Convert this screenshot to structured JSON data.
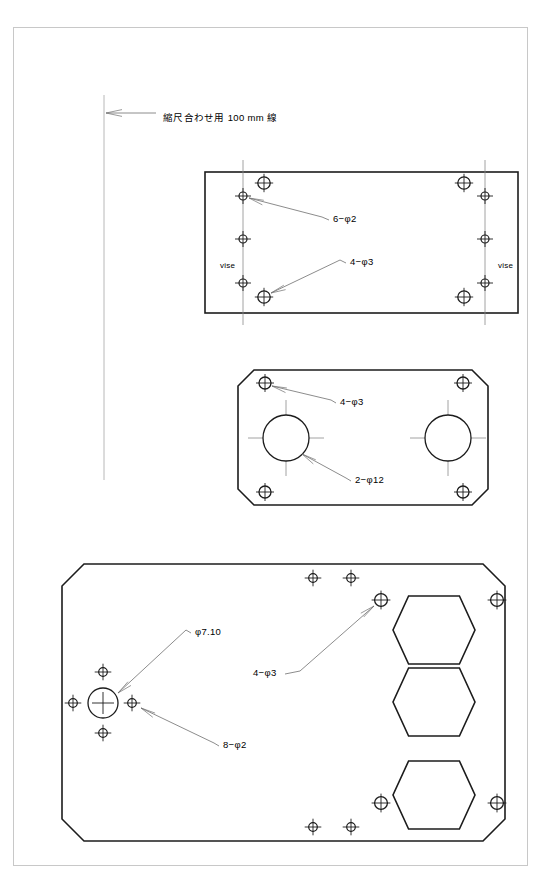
{
  "sheet": {
    "frame": {
      "x": 13,
      "y": 27,
      "width": 514,
      "height": 838
    },
    "background_color": "#ffffff",
    "frame_color": "#c8c8c8",
    "line_color": "#1c1c1c",
    "annotation_color": "#6e6e6e"
  },
  "scale_reference": {
    "label": "縮尺合わせ用 100 mm 線",
    "label_x": 163,
    "label_y": 117,
    "line_x": 104,
    "line_y_top": 95,
    "line_y_bottom": 480,
    "arrow_from_x": 156,
    "arrow_to_x": 106,
    "arrow_y": 113
  },
  "parts": [
    {
      "name": "part-rectangular-plate",
      "outline_type": "rectangle",
      "x": 205,
      "y": 172,
      "width": 313,
      "height": 141,
      "centerlines": [
        {
          "x": 243,
          "y1": 160,
          "y2": 325
        },
        {
          "x": 485,
          "y1": 160,
          "y2": 325
        }
      ],
      "holes_phi3": [
        {
          "cx": 264,
          "cy": 183,
          "r": 6.2
        },
        {
          "cx": 464,
          "cy": 183,
          "r": 6.2
        },
        {
          "cx": 264,
          "cy": 297,
          "r": 6.2
        },
        {
          "cx": 464,
          "cy": 297,
          "r": 6.2
        }
      ],
      "holes_phi2": [
        {
          "cx": 243,
          "cy": 196,
          "r": 4.0
        },
        {
          "cx": 243,
          "cy": 239,
          "r": 4.0
        },
        {
          "cx": 243,
          "cy": 283,
          "r": 4.0
        },
        {
          "cx": 485,
          "cy": 196,
          "r": 4.0
        },
        {
          "cx": 485,
          "cy": 239,
          "r": 4.0
        },
        {
          "cx": 485,
          "cy": 283,
          "r": 4.0
        }
      ],
      "labels": [
        {
          "text": "6−φ2",
          "x": 333,
          "y": 220,
          "leader_to_x": 249,
          "leader_to_y": 198,
          "leader_mid_x": 322,
          "leader_mid_y": 217
        },
        {
          "text": "4−φ3",
          "x": 350,
          "y": 263,
          "leader_to_x": 271,
          "leader_to_y": 293,
          "leader_mid_x": 340,
          "leader_mid_y": 260
        }
      ],
      "side_labels": [
        {
          "text": "vise",
          "x": 220,
          "y": 268
        },
        {
          "text": "vise",
          "x": 498,
          "y": 268
        }
      ]
    },
    {
      "name": "part-chamfered-plate-2holes",
      "outline_type": "chamfered-rectangle",
      "x": 238,
      "y": 370,
      "width": 250,
      "height": 135,
      "chamfer": 16,
      "holes_phi3": [
        {
          "cx": 265,
          "cy": 383,
          "r": 6.0
        },
        {
          "cx": 463,
          "cy": 383,
          "r": 6.0
        },
        {
          "cx": 265,
          "cy": 492,
          "r": 6.0
        },
        {
          "cx": 463,
          "cy": 492,
          "r": 6.0
        }
      ],
      "holes_phi12": [
        {
          "cx": 286,
          "cy": 438,
          "r": 23
        },
        {
          "cx": 448,
          "cy": 438,
          "r": 23
        }
      ],
      "labels": [
        {
          "text": "4−φ3",
          "x": 340,
          "y": 403,
          "leader_to_x": 272,
          "leader_to_y": 386,
          "leader_mid_x": 331,
          "leader_mid_y": 400
        },
        {
          "text": "2−φ12",
          "x": 355,
          "y": 481,
          "leader_to_x": 302,
          "leader_to_y": 454,
          "leader_mid_x": 346,
          "leader_mid_y": 478
        }
      ]
    },
    {
      "name": "part-chamfered-baseplate",
      "outline_type": "chamfered-rectangle",
      "x": 62,
      "y": 564,
      "width": 443,
      "height": 277,
      "chamfer": 22,
      "center_hole": {
        "cx": 103,
        "cy": 703,
        "r": 15,
        "label": "φ7.10"
      },
      "holes_phi2": [
        {
          "cx": 103,
          "cy": 672,
          "r": 4.3
        },
        {
          "cx": 103,
          "cy": 733,
          "r": 4.3
        },
        {
          "cx": 73,
          "cy": 703,
          "r": 4.3
        },
        {
          "cx": 132,
          "cy": 703,
          "r": 4.3
        },
        {
          "cx": 313,
          "cy": 578,
          "r": 4.3
        },
        {
          "cx": 351,
          "cy": 578,
          "r": 4.3
        },
        {
          "cx": 313,
          "cy": 827,
          "r": 4.3
        },
        {
          "cx": 351,
          "cy": 827,
          "r": 4.3
        }
      ],
      "holes_phi3": [
        {
          "cx": 381,
          "cy": 600,
          "r": 6.4
        },
        {
          "cx": 497,
          "cy": 600,
          "r": 6.4
        },
        {
          "cx": 381,
          "cy": 803,
          "r": 6.4
        },
        {
          "cx": 497,
          "cy": 803,
          "r": 6.4
        }
      ],
      "hexagons": [
        {
          "cx": 434,
          "cy": 630,
          "rx": 41,
          "ry": 34
        },
        {
          "cx": 434,
          "cy": 702,
          "rx": 41,
          "ry": 34
        },
        {
          "cx": 434,
          "cy": 795,
          "rx": 41,
          "ry": 34
        }
      ],
      "labels": [
        {
          "text": "φ7.10",
          "x": 195,
          "y": 633,
          "leader_to_x": 118,
          "leader_to_y": 693,
          "leader_mid_x": 186,
          "leader_mid_y": 630
        },
        {
          "text": "8−φ2",
          "x": 223,
          "y": 746,
          "leader_to_x": 141,
          "leader_to_y": 708,
          "leader_mid_x": 214,
          "leader_mid_y": 743
        },
        {
          "text": "4−φ3",
          "x": 253,
          "y": 674,
          "leader_to_x": 374,
          "leader_to_y": 606,
          "leader_mid_x": 300,
          "leader_mid_y": 671
        }
      ]
    }
  ]
}
